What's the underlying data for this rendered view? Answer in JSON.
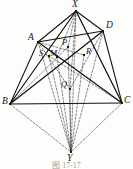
{
  "figure": {
    "caption": "图 17-17",
    "type": "solid-geometry-diagram",
    "background_color": "#fdfdfc",
    "stroke_color": "#1a1a1a",
    "vertices": [
      {
        "id": "X",
        "label": "X",
        "x": 76,
        "y": 11,
        "label_x": 72,
        "label_y": 0,
        "kind": "apex-top"
      },
      {
        "id": "D",
        "label": "D",
        "x": 103,
        "y": 31,
        "label_x": 106,
        "label_y": 21,
        "kind": "base-vertex"
      },
      {
        "id": "A",
        "label": "A",
        "x": 38,
        "y": 42,
        "label_x": 28,
        "label_y": 34,
        "kind": "base-vertex"
      },
      {
        "id": "B",
        "label": "B",
        "x": 10,
        "y": 104,
        "label_x": 2,
        "label_y": 98,
        "kind": "base-vertex"
      },
      {
        "id": "C",
        "label": "C",
        "x": 122,
        "y": 103,
        "label_x": 124,
        "label_y": 97,
        "kind": "base-vertex"
      },
      {
        "id": "Y",
        "label": "Y",
        "x": 71,
        "y": 152,
        "label_x": 68,
        "label_y": 155,
        "kind": "apex-bottom"
      }
    ],
    "interior_points": [
      {
        "id": "P",
        "label": "P",
        "x": 68,
        "y": 47,
        "label_x": 62,
        "label_y": 38
      },
      {
        "id": "S",
        "label": "S",
        "x": 49,
        "y": 56,
        "label_x": 40,
        "label_y": 50
      },
      {
        "id": "M",
        "label": "M",
        "x": 57,
        "y": 57,
        "label_x": 50,
        "label_y": 50
      },
      {
        "id": "R",
        "label": "R",
        "x": 84,
        "y": 55,
        "label_x": 86,
        "label_y": 48
      },
      {
        "id": "Q",
        "label": "Q",
        "x": 70,
        "y": 89,
        "label_x": 62,
        "label_y": 80
      }
    ],
    "solid_edges": [
      {
        "from": "A",
        "to": "X",
        "name": "edge-a-x"
      },
      {
        "from": "X",
        "to": "D",
        "name": "edge-x-d"
      },
      {
        "from": "A",
        "to": "D",
        "name": "edge-a-d"
      },
      {
        "from": "A",
        "to": "B",
        "name": "edge-a-b"
      },
      {
        "from": "B",
        "to": "C",
        "name": "edge-b-c"
      },
      {
        "from": "C",
        "to": "D",
        "name": "edge-c-d"
      },
      {
        "from": "B",
        "to": "X",
        "name": "edge-b-x"
      },
      {
        "from": "X",
        "to": "C",
        "name": "edge-x-c"
      },
      {
        "from": "B",
        "to": "D",
        "name": "edge-b-d"
      },
      {
        "from": "A",
        "to": "C",
        "name": "edge-a-c"
      }
    ],
    "dashed_edges": [
      {
        "from": "B",
        "to": "Y",
        "name": "edge-b-y"
      },
      {
        "from": "C",
        "to": "Y",
        "name": "edge-c-y"
      },
      {
        "from": "A",
        "to": "Y",
        "name": "edge-a-y"
      },
      {
        "from": "D",
        "to": "Y",
        "name": "edge-d-y"
      },
      {
        "from": "X",
        "to": "Y",
        "name": "edge-x-y"
      },
      {
        "from": "X",
        "to": "B",
        "name": "edge-x-b-hidden"
      },
      {
        "from": "X",
        "to": "A",
        "name": "edge-x-a-hidden"
      },
      {
        "from": "X",
        "to": "Q",
        "name": "edge-x-q"
      },
      {
        "from": "Q",
        "to": "Y",
        "name": "edge-q-y"
      },
      {
        "from": "A",
        "to": "M",
        "name": "edge-a-m"
      },
      {
        "from": "M",
        "to": "C",
        "name": "edge-m-c"
      },
      {
        "from": "D",
        "to": "M",
        "name": "edge-d-m"
      },
      {
        "from": "M",
        "to": "B",
        "name": "edge-m-b"
      }
    ]
  }
}
